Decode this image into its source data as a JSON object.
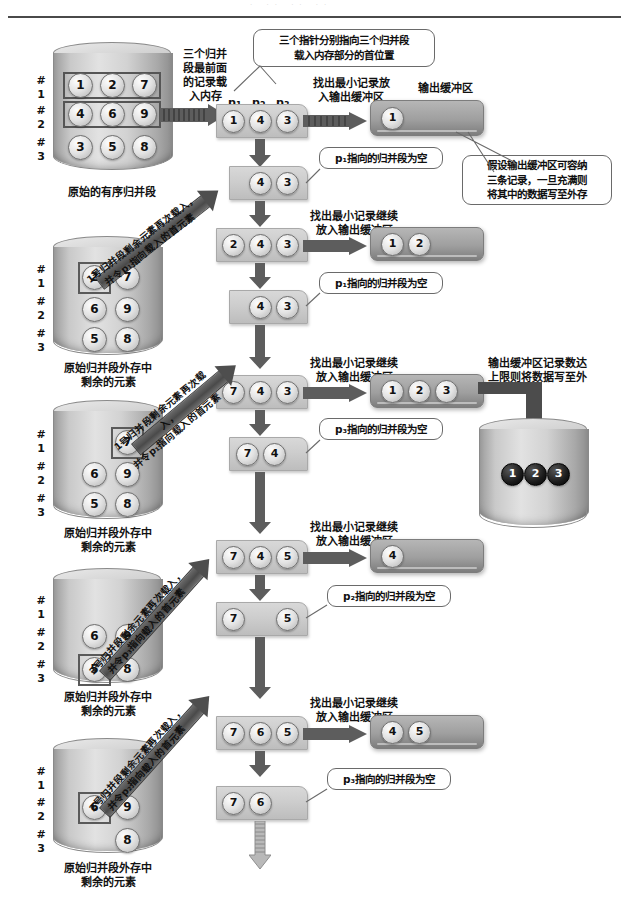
{
  "page": {
    "header_ghost": "· ·· ·· ··"
  },
  "pointers": {
    "p1": "p",
    "p2": "p",
    "p3": "p",
    "sub1": "1",
    "sub2": "2",
    "sub3": "3"
  },
  "left_labels": {
    "load_front": "三个归并\n段最前面\n的记录载\n入内存",
    "caption_first": "原始的有序归并段",
    "caption_rest": "原始归并段外存中\n剩余的元素",
    "seg_markers": [
      "#",
      "1",
      "#",
      "2",
      "#",
      "3"
    ]
  },
  "top_labels": {
    "find_min_first": "找出最小记录放\n入输出缓冲区",
    "output_buffer": "输出缓冲区",
    "find_min_cont": "找出最小记录继续\n放入输出缓冲区",
    "write_to_disk": "输出缓冲区记录数达\n上限则将数据写至外"
  },
  "callouts": {
    "three_pointers": "三个指针分别指向三个归并段\n载入内存部分的首位置",
    "buffer_capacity": "假设输出缓冲区可容纳\n三条记录，一旦充满则\n将其中的数据写至外存",
    "p1_empty": "p₁指向的归并段为空",
    "p3_empty_a": "p₃指向的归并段为空",
    "p2_empty": "p₂指向的归并段为空",
    "p3_empty_b": "p₃指向的归并段为空"
  },
  "diagonal_labels": {
    "seg1_reload": "1号归并段剩余元素再次载入，\n并令p₁指向载入的首元素",
    "seg1_reload2": "1号归并段剩余元素再次载入，\n并令p₁指向载入的首元素",
    "seg3_reload": "3号归并段剩余元素再次载入，\n并令p₃指向载入的首元素",
    "seg2_reload": "2号归并段剩余元素再次载入，\n并令p₂指向载入的首元素"
  },
  "disks": [
    {
      "id": "disk-initial",
      "caption": "原始的有序归并段",
      "rows": [
        [
          "1",
          "2",
          "7"
        ],
        [
          "4",
          "6",
          "9"
        ],
        [
          "3",
          "5",
          "8"
        ]
      ],
      "boxed_rows": [
        0,
        1
      ],
      "boxed_cells": []
    },
    {
      "id": "disk-remain-1",
      "caption": "原始归并段外存中\n剩余的元素",
      "rows": [
        [
          "2",
          "7"
        ],
        [
          "6",
          "9"
        ],
        [
          "5",
          "8"
        ]
      ],
      "boxed_rows": [],
      "boxed_cells": [
        [
          0,
          0
        ]
      ]
    },
    {
      "id": "disk-remain-2",
      "caption": "原始归并段外存中\n剩余的元素",
      "rows": [
        [
          "7"
        ],
        [
          "6",
          "9"
        ],
        [
          "5",
          "8"
        ]
      ],
      "boxed_rows": [],
      "boxed_cells": [
        [
          0,
          0
        ]
      ]
    },
    {
      "id": "disk-remain-3",
      "caption": "原始归并段外存中\n剩余的元素",
      "rows": [
        [],
        [
          "6",
          "9"
        ],
        [
          "5",
          "8"
        ]
      ],
      "boxed_rows": [],
      "boxed_cells": [
        [
          2,
          0
        ]
      ]
    },
    {
      "id": "disk-remain-4",
      "caption": "原始归并段外存中\n剩余的元素",
      "rows": [
        [],
        [
          "6",
          "9"
        ],
        [
          "8"
        ]
      ],
      "boxed_rows": [],
      "boxed_cells": [
        [
          1,
          0
        ]
      ]
    }
  ],
  "memory_states": [
    {
      "id": "mem-1",
      "values": [
        "1",
        "4",
        "3"
      ]
    },
    {
      "id": "mem-2",
      "values": [
        "4",
        "3"
      ]
    },
    {
      "id": "mem-3",
      "values": [
        "2",
        "4",
        "3"
      ]
    },
    {
      "id": "mem-4",
      "values": [
        "4",
        "3"
      ]
    },
    {
      "id": "mem-5",
      "values": [
        "7",
        "4",
        "3"
      ]
    },
    {
      "id": "mem-6",
      "values": [
        "7",
        "4"
      ]
    },
    {
      "id": "mem-7",
      "values": [
        "7",
        "4",
        "5"
      ]
    },
    {
      "id": "mem-8",
      "values": [
        "7",
        "5"
      ]
    },
    {
      "id": "mem-9",
      "values": [
        "7",
        "6",
        "5"
      ]
    },
    {
      "id": "mem-10",
      "values": [
        "7",
        "6"
      ]
    }
  ],
  "output_buffers": [
    {
      "id": "outbuf-1",
      "values": [
        "1"
      ]
    },
    {
      "id": "outbuf-2",
      "values": [
        "1",
        "2"
      ]
    },
    {
      "id": "outbuf-3",
      "values": [
        "1",
        "2",
        "3"
      ]
    },
    {
      "id": "outbuf-4",
      "values": [
        "4"
      ]
    },
    {
      "id": "outbuf-5",
      "values": [
        "4",
        "5"
      ]
    }
  ],
  "output_disk": {
    "id": "output-disk",
    "values": [
      "1",
      "2",
      "3"
    ]
  }
}
